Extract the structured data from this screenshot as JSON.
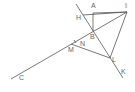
{
  "diagram": {
    "type": "geometry",
    "stroke_color": "#555555",
    "points": {
      "A": {
        "label": "A",
        "x": 93,
        "y": 13
      },
      "I": {
        "label": "I",
        "x": 127,
        "y": 12
      },
      "H": {
        "label": "H",
        "x": 83,
        "y": 15
      },
      "B": {
        "label": "B",
        "x": 93,
        "y": 31
      },
      "N": {
        "label": "N",
        "x": 76,
        "y": 41
      },
      "M": {
        "label": "M",
        "x": 71,
        "y": 44
      },
      "L": {
        "label": "L",
        "x": 110,
        "y": 58
      },
      "K": {
        "label": "K",
        "x": 123,
        "y": 78
      },
      "C": {
        "label": "C",
        "x": 11,
        "y": 79
      }
    },
    "segments": [
      [
        "line-top",
        "K"
      ],
      [
        "C",
        "I"
      ],
      [
        "H",
        "I"
      ],
      [
        "A",
        "I"
      ],
      [
        "A",
        "B"
      ],
      [
        "I",
        "L"
      ],
      [
        "M",
        "L"
      ]
    ]
  }
}
